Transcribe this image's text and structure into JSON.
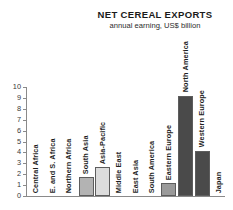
{
  "chart": {
    "title": "NET CEREAL EXPORTS",
    "subtitle": "annual earning, US$ billion"
  },
  "chart_data": {
    "type": "bar",
    "title": "NET CEREAL EXPORTS",
    "subtitle": "annual earning, US$ billion",
    "xlabel": "",
    "ylabel": "",
    "ylim": [
      0,
      10
    ],
    "yticks": [
      "0",
      "1",
      "2",
      "3",
      "4",
      "5",
      "6",
      "7",
      "8",
      "9",
      "10"
    ],
    "grid": false,
    "legend": "none",
    "categories": [
      "Central Africa",
      "E. and S. Africa",
      "Northern Africa",
      "South Asia",
      "Asia-Pacific",
      "Middle East",
      "East Asia",
      "South America",
      "Eastern Europe",
      "North America",
      "Western Europe",
      "Japan"
    ],
    "values": [
      0,
      0,
      0,
      1.75,
      2.65,
      0,
      0,
      0,
      1.15,
      9.2,
      4.15,
      0
    ],
    "bar_colors": [
      "none",
      "none",
      "none",
      "#b3b3b3",
      "#dcdcdc",
      "none",
      "none",
      "none",
      "#9a9a9a",
      "#4a4a4a",
      "#4a4a4a",
      "none"
    ]
  }
}
